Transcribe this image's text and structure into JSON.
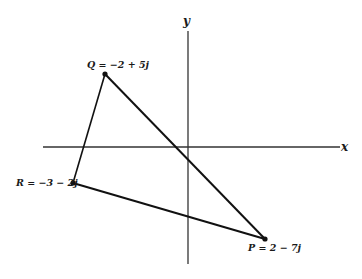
{
  "diagram": {
    "type": "argand-diagram",
    "axes": {
      "x_label": "x",
      "y_label": "y",
      "origin_px": [
        188,
        147
      ]
    },
    "points": [
      {
        "id": "Q",
        "label": "Q = −2 + 5j",
        "px": [
          105,
          74
        ]
      },
      {
        "id": "R",
        "label": "R = −3 − 2j",
        "px": [
          73,
          183
        ]
      },
      {
        "id": "P",
        "label": "P = 2 − 7j",
        "px": [
          265,
          239
        ]
      }
    ],
    "edges": [
      [
        "Q",
        "P"
      ],
      [
        "P",
        "R"
      ],
      [
        "R",
        "Q"
      ]
    ],
    "colors": {
      "line": "#111111",
      "axis": "#222222"
    }
  }
}
